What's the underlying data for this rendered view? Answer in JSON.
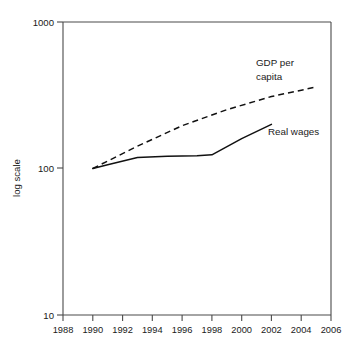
{
  "chart_data": {
    "type": "line",
    "title": "",
    "xlabel": "",
    "ylabel": "log scale",
    "yscale": "log",
    "ylim": [
      10,
      1000
    ],
    "xlim": [
      1988,
      2006
    ],
    "grid": false,
    "legend_position": "inline-annotations",
    "y_ticks": [
      "10",
      "100",
      "1000"
    ],
    "y_tick_values": [
      10,
      100,
      1000
    ],
    "x_ticks": [
      "1988",
      "1990",
      "1992",
      "1994",
      "1996",
      "1998",
      "2000",
      "2002",
      "2004",
      "2006"
    ],
    "x_tick_values": [
      1988,
      1990,
      1992,
      1994,
      1996,
      1998,
      2000,
      2002,
      2004,
      2006
    ],
    "series": [
      {
        "name": "Real wages",
        "style": "solid",
        "color": "#111111",
        "x": [
          1990,
          1991,
          1993,
          1995,
          1997,
          1998,
          2000,
          2002
        ],
        "values": [
          100,
          106,
          119,
          121,
          122,
          124,
          160,
          200
        ]
      },
      {
        "name": "GDP per capita",
        "style": "dashed",
        "color": "#111111",
        "x": [
          1990,
          1993,
          1996,
          1999,
          2002,
          2005
        ],
        "values": [
          100,
          142,
          196,
          252,
          310,
          360
        ]
      }
    ],
    "annotations": [
      {
        "text_line1": "GDP per",
        "text_line2": "capita",
        "x": 2001.0,
        "y": 560
      },
      {
        "text_line1": "Real wages",
        "text_line2": "",
        "x": 2001.8,
        "y": 228
      }
    ]
  },
  "labels": {
    "y_axis_title": "log scale",
    "annotation_gdp_line1": "GDP per",
    "annotation_gdp_line2": "capita",
    "annotation_wages": "Real wages",
    "ytick_1000": "1000",
    "ytick_100": "100",
    "ytick_10": "10",
    "xtick_1988": "1988",
    "xtick_1990": "1990",
    "xtick_1992": "1992",
    "xtick_1994": "1994",
    "xtick_1996": "1996",
    "xtick_1998": "1998",
    "xtick_2000": "2000",
    "xtick_2002": "2002",
    "xtick_2004": "2004",
    "xtick_2006": "2006"
  }
}
